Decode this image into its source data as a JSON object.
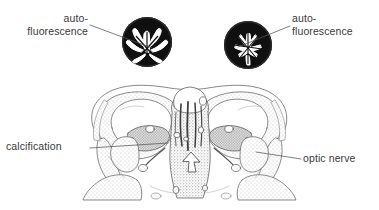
{
  "figure": {
    "type": "anatomical-illustration",
    "background_color": "#ffffff",
    "ink_color": "#3a3a3a",
    "inset_fill_color": "#111111",
    "inset_pattern_color": "#ffffff",
    "width": 379,
    "height": 210
  },
  "labels": {
    "auto_left": {
      "line1": "auto-",
      "line2": "fluorescence"
    },
    "auto_right": {
      "line1": "auto-",
      "line2": "fluorescence"
    },
    "calcification": "calcification",
    "optic_nerve": "optic nerve"
  },
  "insets": [
    {
      "name": "left-autofluorescence-disc",
      "cx": 147,
      "cy": 42,
      "r": 25,
      "description": "dark round section with branching white autofluorescent pattern"
    },
    {
      "name": "right-autofluorescence-disc",
      "cx": 248,
      "cy": 45,
      "r": 24,
      "description": "dark round section with radial white autofluorescent pattern"
    }
  ],
  "leaders": [
    {
      "name": "leader-auto-left",
      "from": [
        90,
        25
      ],
      "to": [
        152,
        48
      ]
    },
    {
      "name": "leader-auto-right",
      "from": [
        290,
        26
      ],
      "to": [
        238,
        47
      ]
    },
    {
      "name": "leader-calcification",
      "from": [
        90,
        148
      ],
      "to": [
        168,
        143
      ]
    },
    {
      "name": "leader-optic-nerve",
      "from": [
        301,
        159
      ],
      "to": [
        256,
        152
      ]
    }
  ]
}
